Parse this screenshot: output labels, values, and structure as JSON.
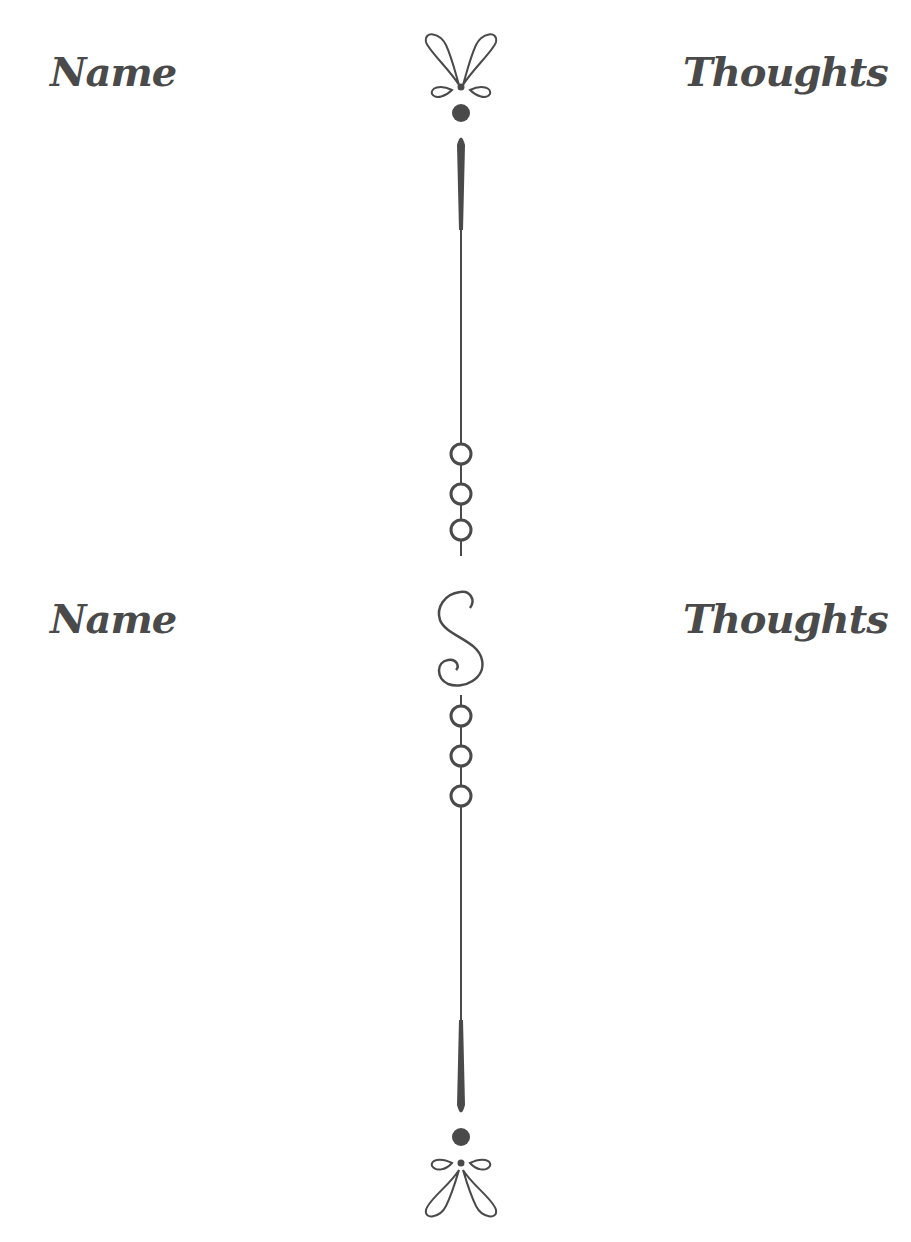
{
  "sections": [
    {
      "left_heading": "Name",
      "right_heading": "Thoughts"
    },
    {
      "left_heading": "Name",
      "right_heading": "Thoughts"
    }
  ],
  "colors": {
    "ink": "#4a4a4a",
    "background": "#ffffff"
  }
}
